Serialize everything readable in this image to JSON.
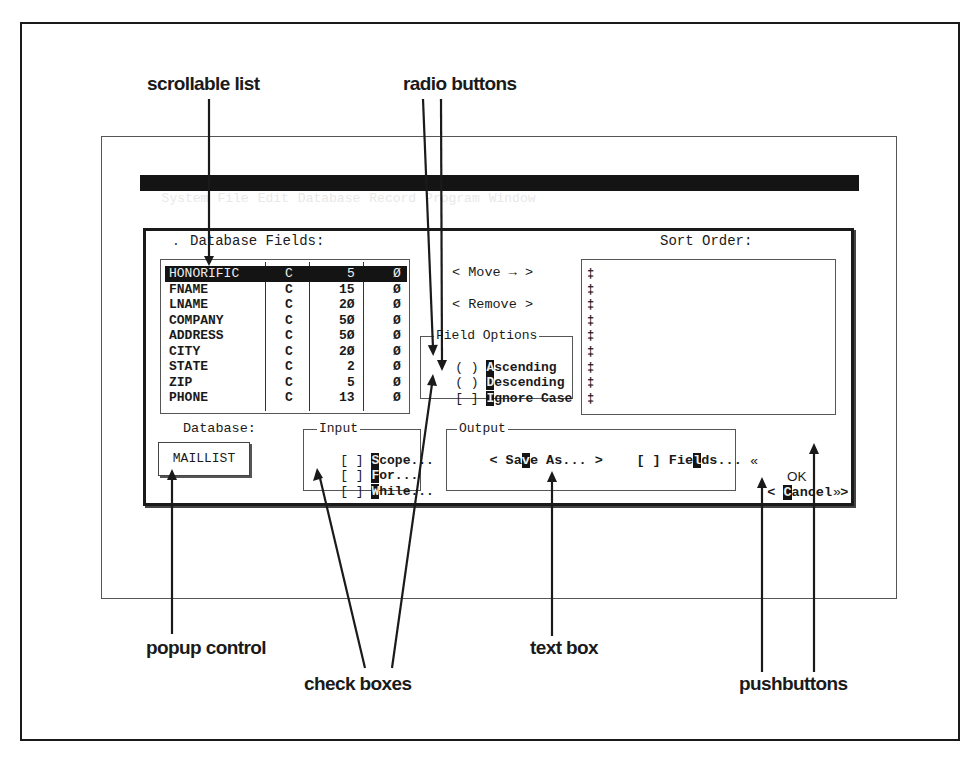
{
  "callouts": {
    "scrollable_list": "scrollable list",
    "radio_buttons": "radio buttons",
    "popup_control": "popup control",
    "check_boxes": "check boxes",
    "text_box": "text box",
    "pushbuttons": "pushbuttons"
  },
  "menubar": {
    "items": [
      "System",
      "File",
      "Edit",
      "Database",
      "Record",
      "Program",
      "Window"
    ]
  },
  "dialog": {
    "fields_label": "Database Fields:",
    "fields_marker": ".",
    "fields": [
      {
        "name": "HONORIFIC",
        "type": "C",
        "width": "5",
        "dec": "Ø",
        "selected": true
      },
      {
        "name": "FNAME",
        "type": "C",
        "width": "15",
        "dec": "Ø"
      },
      {
        "name": "LNAME",
        "type": "C",
        "width": "2Ø",
        "dec": "Ø"
      },
      {
        "name": "COMPANY",
        "type": "C",
        "width": "5Ø",
        "dec": "Ø"
      },
      {
        "name": "ADDRESS",
        "type": "C",
        "width": "5Ø",
        "dec": "Ø"
      },
      {
        "name": "CITY",
        "type": "C",
        "width": "2Ø",
        "dec": "Ø"
      },
      {
        "name": "STATE",
        "type": "C",
        "width": "2",
        "dec": "Ø"
      },
      {
        "name": "ZIP",
        "type": "C",
        "width": "5",
        "dec": "Ø"
      },
      {
        "name": "PHONE",
        "type": "C",
        "width": "13",
        "dec": "Ø"
      }
    ],
    "move_button": "< Move → >",
    "remove_button": "< Remove >",
    "field_options": {
      "legend": "Field Options",
      "ascending": {
        "mark": "( )",
        "hot": "A",
        "rest": "scending"
      },
      "descending": {
        "mark": "( )",
        "hot": "D",
        "rest": "escending"
      },
      "ignore_case": {
        "mark": "[ ]",
        "hot": "I",
        "rest": "gnore Case"
      }
    },
    "sort_order_label": "Sort Order:",
    "sort_order_markers": [
      "‡",
      "‡",
      "‡",
      "‡",
      "‡",
      "‡",
      "‡",
      "‡",
      "‡"
    ],
    "database_label": "Database:",
    "database_value": "MAILLIST",
    "input_group": {
      "legend": "Input",
      "scope": {
        "mark": "[ ]",
        "hot": "S",
        "rest": "cope..."
      },
      "for": {
        "mark": "[ ]",
        "hot": "F",
        "rest": "or..."
      },
      "while": {
        "mark": "[ ]",
        "hot": "W",
        "rest": "hile..."
      }
    },
    "output_group": {
      "legend": "Output",
      "save_as": {
        "pre": "< Sa",
        "hot": "v",
        "post": "e As... >"
      },
      "fields": {
        "mark": "[ ]",
        "pre": "Fie",
        "hot": "l",
        "post": "ds..."
      }
    },
    "ok_button": {
      "left": "«",
      "label": "OK",
      "right": "»"
    },
    "cancel_button": {
      "left": "<",
      "hot": "C",
      "rest": "ancel",
      "right": ">"
    }
  }
}
